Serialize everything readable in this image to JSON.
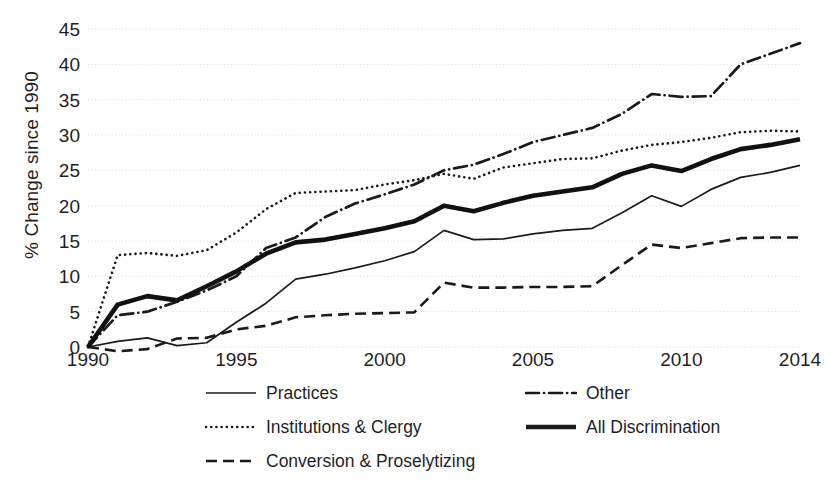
{
  "chart_data": {
    "type": "line",
    "title": "",
    "xlabel": "",
    "ylabel": "% Change since 1990",
    "xlim": [
      1990,
      2014
    ],
    "ylim": [
      0,
      45
    ],
    "ytick_values": [
      0,
      5,
      10,
      15,
      20,
      25,
      30,
      35,
      40,
      45
    ],
    "ytick_labels": [
      "0",
      "5",
      "10",
      "15",
      "20",
      "25",
      "30",
      "35",
      "40",
      "45"
    ],
    "xtick_values": [
      1990,
      1995,
      2000,
      2005,
      2010,
      2014
    ],
    "xtick_labels": [
      "1990",
      "1995",
      "2000",
      "2005",
      "2010",
      "2014"
    ],
    "grid": "horizontal-dotted",
    "legend_position": "bottom",
    "x": [
      1990,
      1991,
      1992,
      1993,
      1994,
      1995,
      1996,
      1997,
      1998,
      1999,
      2000,
      2001,
      2002,
      2003,
      2004,
      2005,
      2006,
      2007,
      2008,
      2009,
      2010,
      2011,
      2012,
      2013,
      2014
    ],
    "series": [
      {
        "name": "Practices",
        "style": "solid-thin",
        "color": "#1a1a1a",
        "values": [
          0.0,
          0.8,
          1.3,
          0.2,
          0.6,
          3.5,
          6.2,
          9.6,
          10.3,
          11.2,
          12.2,
          13.5,
          16.5,
          15.2,
          15.3,
          16.0,
          16.5,
          16.8,
          19.0,
          21.4,
          19.9,
          22.3,
          24.0,
          24.7,
          25.7
        ]
      },
      {
        "name": "Institutions & Clergy",
        "style": "dotted",
        "color": "#1a1a1a",
        "values": [
          0.0,
          13.0,
          13.3,
          12.9,
          13.7,
          16.2,
          19.5,
          21.8,
          22.0,
          22.2,
          23.0,
          23.6,
          24.5,
          23.8,
          25.4,
          26.0,
          26.6,
          26.7,
          27.8,
          28.6,
          29.0,
          29.6,
          30.4,
          30.6,
          30.5
        ]
      },
      {
        "name": "Conversion & Proselytizing",
        "style": "dashed",
        "color": "#1a1a1a",
        "values": [
          0.0,
          -0.6,
          -0.3,
          1.2,
          1.3,
          2.5,
          3.0,
          4.2,
          4.5,
          4.7,
          4.8,
          4.9,
          9.1,
          8.4,
          8.4,
          8.5,
          8.5,
          8.6,
          11.6,
          14.5,
          14.0,
          14.7,
          15.4,
          15.5,
          15.5
        ]
      },
      {
        "name": "Other",
        "style": "dash-dot",
        "color": "#1a1a1a",
        "values": [
          0.0,
          4.5,
          5.0,
          6.4,
          8.0,
          10.0,
          14.0,
          15.5,
          18.4,
          20.3,
          21.6,
          23.0,
          25.0,
          25.8,
          27.3,
          29.0,
          30.0,
          31.0,
          33.0,
          35.8,
          35.4,
          35.5,
          40.0,
          41.5,
          43.0
        ]
      },
      {
        "name": "All Discrimination",
        "style": "solid-thick",
        "color": "#111111",
        "values": [
          0.0,
          6.0,
          7.2,
          6.6,
          8.6,
          10.7,
          13.2,
          14.8,
          15.2,
          16.0,
          16.8,
          17.8,
          20.0,
          19.2,
          20.4,
          21.4,
          22.0,
          22.6,
          24.5,
          25.7,
          24.9,
          26.6,
          28.0,
          28.6,
          29.4
        ]
      }
    ]
  },
  "legend": {
    "items": [
      {
        "label": "Practices",
        "style": "solid-thin"
      },
      {
        "label": "Other",
        "style": "dash-dot"
      },
      {
        "label": "Institutions & Clergy",
        "style": "dotted"
      },
      {
        "label": "All Discrimination",
        "style": "solid-thick"
      },
      {
        "label": "Conversion & Proselytizing",
        "style": "dashed"
      }
    ]
  },
  "colors": {
    "line": "#1a1a1a",
    "grid": "#d8d8d8",
    "text": "#1f1f1f",
    "background": "#ffffff"
  }
}
